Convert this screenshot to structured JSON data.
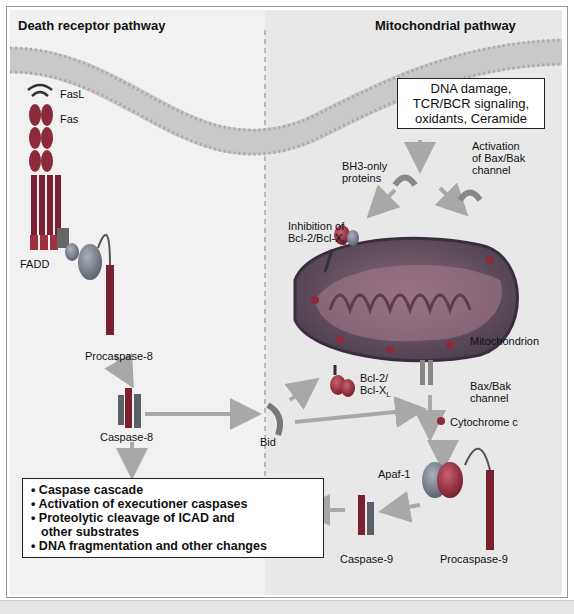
{
  "left_panel": {
    "title": "Death receptor pathway",
    "labels": {
      "fasl": "FasL",
      "fas": "Fas",
      "fadd": "FADD",
      "procaspase8": "Procaspase-8",
      "caspase8": "Caspase-8",
      "bid": "Bid"
    }
  },
  "right_panel": {
    "title": "Mitochondrial pathway",
    "stimuli_box": [
      "DNA damage,",
      "TCR/BCR signaling,",
      "oxidants, Ceramide"
    ],
    "labels": {
      "bh3": [
        "BH3-only",
        "proteins"
      ],
      "bax_activation": [
        "Activation",
        "of Bax/Bak",
        "channel"
      ],
      "bcl_inhibition": [
        "Inhibition of",
        "Bcl-2/Bcl-X",
        "L"
      ],
      "mitochondrion": "Mitochondrion",
      "bcl2": [
        "Bcl-2/",
        "Bcl-X",
        "L"
      ],
      "bax_channel": [
        "Bax/Bak",
        "channel"
      ],
      "cytochrome_c": "Cytochrome c",
      "apaf1": "Apaf-1",
      "caspase9": "Caspase-9",
      "procaspase9": "Procaspase-9"
    }
  },
  "outcome_box": {
    "items": [
      "• Caspase cascade",
      "• Activation of executioner caspases",
      "• Proteolytic cleavage of ICAD and",
      "  other substrates",
      "• DNA fragmentation and other changes"
    ]
  },
  "colors": {
    "left_bg": "#f0f0f0",
    "right_bg": "#e9e9e9",
    "membrane": "#b8b8b8",
    "arrow": "#a8a8a8",
    "mito_outer": "#5a4d5e",
    "mito_inner": "#7a5a6a",
    "protein_red": "#8b2a3a",
    "protein_gray": "#7d7d88"
  }
}
